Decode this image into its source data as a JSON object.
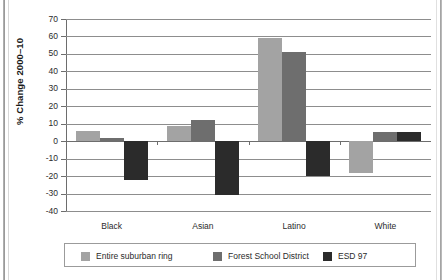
{
  "chart_data": {
    "type": "bar",
    "title": "",
    "subtitle": "",
    "xlabel": "",
    "ylabel": "% Change 2000–10",
    "categories": [
      "Black",
      "Asian",
      "Latino",
      "White"
    ],
    "ylim": [
      -40,
      70
    ],
    "ytick_labels": [
      "70",
      "60",
      "50",
      "40",
      "30",
      "20",
      "10",
      "0",
      "-10",
      "-20",
      "-30",
      "-40"
    ],
    "ytick_values": [
      70,
      60,
      50,
      40,
      30,
      20,
      10,
      0,
      -10,
      -20,
      -30,
      -40
    ],
    "grid": true,
    "legend_position": "bottom",
    "series": [
      {
        "name": "Entire suburban ring",
        "color": "#a3a3a3",
        "values": [
          6,
          8.5,
          59,
          -18
        ]
      },
      {
        "name": "Forest School District",
        "color": "#6e6e6e",
        "values": [
          2,
          12,
          51,
          5
        ]
      },
      {
        "name": "ESD 97",
        "color": "#2b2b2b",
        "values": [
          -22,
          -31,
          -20,
          5
        ]
      }
    ]
  },
  "legend": {
    "items": [
      {
        "label": "Entire suburban ring",
        "color": "#a3a3a3"
      },
      {
        "label": "Forest School District",
        "color": "#6e6e6e"
      },
      {
        "label": "ESD 97",
        "color": "#2b2b2b"
      }
    ]
  },
  "colors": {
    "axis": "#6d6d6d",
    "gridline": "#8d8d8d",
    "text": "#2b2b2b",
    "background": "#ffffff"
  }
}
